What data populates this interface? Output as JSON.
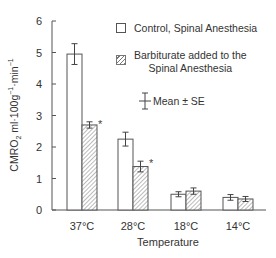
{
  "chart_data": {
    "type": "bar",
    "title": "",
    "xlabel": "Temperature",
    "ylabel": "CMRO2 ml·100g-1·min-1",
    "ylim": [
      0,
      6
    ],
    "yticks": [
      0,
      1,
      2,
      3,
      4,
      5,
      6
    ],
    "categories": [
      "37°C",
      "28°C",
      "18°C",
      "14°C"
    ],
    "series": [
      {
        "name": "Control, Spinal Anesthesia",
        "pattern": "open",
        "values": [
          4.95,
          2.25,
          0.5,
          0.4
        ],
        "se": [
          0.33,
          0.22,
          0.08,
          0.09
        ]
      },
      {
        "name": "Barbiturate added to the Spinal Anesthesia",
        "pattern": "hatched",
        "values": [
          2.7,
          1.38,
          0.6,
          0.35
        ],
        "se": [
          0.1,
          0.17,
          0.1,
          0.08
        ]
      }
    ],
    "annotations": [
      {
        "category": "37°C",
        "series": 1,
        "text": "*"
      },
      {
        "category": "28°C",
        "series": 1,
        "text": "*"
      }
    ],
    "legend": {
      "position": "top-right",
      "errorbar_label": "Mean ± SE"
    },
    "grid": false
  },
  "labels": {
    "ylabel_main": "CMRO",
    "ylabel_sub": "2",
    "ylabel_rest": " ml·100g",
    "ylabel_sup1": "−1",
    "ylabel_mid": "·min",
    "ylabel_sup2": "−1",
    "xlabel": "Temperature",
    "legend_control": "Control, Spinal Anesthesia",
    "legend_barb_line1": "Barbiturate added to the",
    "legend_barb_line2": "Spinal Anesthesia",
    "legend_errorbar": "Mean ± SE"
  }
}
